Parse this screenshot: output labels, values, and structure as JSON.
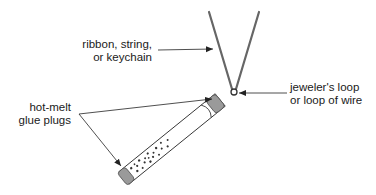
{
  "diagram": {
    "type": "labeled illustration",
    "labels": {
      "ribbon": {
        "line1": "ribbon, string,",
        "line2": "or keychain"
      },
      "loop": {
        "line1": "jeweler's loop",
        "line2": "or loop of wire"
      },
      "glue": {
        "line1": "hot-melt",
        "line2": "glue plugs"
      }
    },
    "colors": {
      "line": "#333333",
      "string": "#666666",
      "plug_fill": "#9a9a9a",
      "tube_fill": "#ffffff",
      "speckle": "#333333",
      "text": "#1a1a1a"
    }
  }
}
